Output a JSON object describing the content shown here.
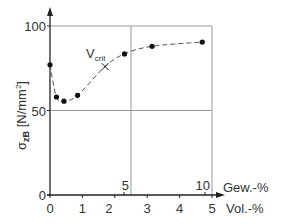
{
  "chart_data": {
    "type": "scatter",
    "title": "",
    "ylabel": "σzB [N/mm²]",
    "ylabel_parts": {
      "sigma": "σ",
      "sub": "zB",
      "unit": " [N/mm",
      "sup": "2",
      "close": "]"
    },
    "xlabel_top": "Gew.-%",
    "xlabel_bottom": "Vol.-%",
    "ylim": [
      0,
      100
    ],
    "xlim": [
      0,
      5
    ],
    "y_ticks": [
      {
        "value": 0,
        "label": "0"
      },
      {
        "value": 50,
        "label": "50"
      },
      {
        "value": 100,
        "label": "100"
      }
    ],
    "x_ticks_vol": [
      {
        "value": 0,
        "label": "0"
      },
      {
        "value": 1,
        "label": "1"
      },
      {
        "value": 2,
        "label": "2"
      },
      {
        "value": 3,
        "label": "3"
      },
      {
        "value": 4,
        "label": "4"
      },
      {
        "value": 5,
        "label": "5"
      }
    ],
    "x_ticks_gew": [
      {
        "vol_position": 2.5,
        "label": "5"
      },
      {
        "vol_position": 5.0,
        "label": "10"
      }
    ],
    "grid": {
      "horizontal": [
        50,
        100
      ],
      "vertical_vol": [
        2.5,
        5
      ]
    },
    "series": [
      {
        "name": "σzB",
        "marker": "circle",
        "line": "dashed",
        "x": [
          0,
          0.2,
          0.43,
          0.85,
          2.3,
          3.15,
          4.7
        ],
        "y": [
          77,
          58,
          55.5,
          59,
          83.5,
          88,
          90.5
        ]
      }
    ],
    "annotations": [
      {
        "text": "V",
        "sub": "crit",
        "marker": "cross",
        "x": 1.7,
        "y": 76
      }
    ],
    "curve_path_points": [
      [
        0,
        77
      ],
      [
        0.2,
        58
      ],
      [
        0.43,
        55.5
      ],
      [
        0.85,
        59
      ],
      [
        1.7,
        76
      ],
      [
        2.3,
        83.5
      ],
      [
        3.15,
        88
      ],
      [
        4.7,
        90.5
      ]
    ]
  }
}
